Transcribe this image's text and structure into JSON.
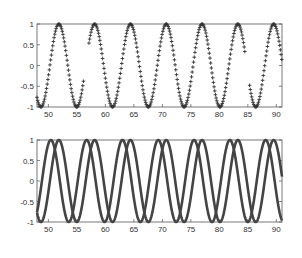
{
  "chart_data": [
    {
      "type": "scatter",
      "title": "",
      "xlabel": "",
      "ylabel": "",
      "xlim": [
        48,
        91
      ],
      "ylim": [
        -1,
        1
      ],
      "xticks": [
        50,
        55,
        60,
        65,
        70,
        75,
        80,
        85,
        90
      ],
      "yticks": [
        1,
        0.5,
        0,
        -0.5,
        -1
      ],
      "marker": "+",
      "grid": false,
      "series": [
        {
          "name": "sin(x) samples",
          "function": "sin",
          "phase": 0,
          "x_range": [
            48,
            91
          ],
          "step": 0.12,
          "gaps": [
            [
              56.2,
              57.0
            ],
            [
              84.6,
              85.3
            ]
          ]
        }
      ]
    },
    {
      "type": "line",
      "title": "",
      "xlabel": "",
      "ylabel": "",
      "xlim": [
        48,
        91
      ],
      "ylim": [
        -1,
        1
      ],
      "xticks": [
        50,
        55,
        60,
        65,
        70,
        75,
        80,
        85,
        90
      ],
      "yticks": [
        1,
        0.5,
        0,
        -0.5,
        -1
      ],
      "grid": false,
      "series": [
        {
          "name": "sin(x)",
          "function": "sin",
          "phase": 0
        },
        {
          "name": "sin(x+1.4)",
          "function": "sin",
          "phase": 1.4
        }
      ]
    }
  ],
  "axes": {
    "top": {
      "xtick_labels": [
        "50",
        "55",
        "60",
        "65",
        "70",
        "75",
        "80",
        "85",
        "90"
      ],
      "ytick_labels": [
        "1",
        "0.5",
        "0",
        "-0.5",
        "-1"
      ]
    },
    "bottom": {
      "xtick_labels": [
        "50",
        "55",
        "60",
        "65",
        "70",
        "75",
        "80",
        "85",
        "90"
      ],
      "ytick_labels": [
        "1",
        "0.5",
        "0",
        "-0.5",
        "-1"
      ]
    }
  },
  "colors": {
    "data": "#333333",
    "axes": "#555555"
  }
}
